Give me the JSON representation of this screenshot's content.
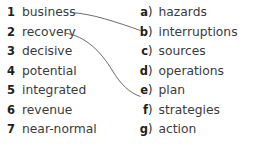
{
  "exercise": {
    "title": "matching-exercise",
    "background_color": "#ffffff",
    "text_color": "#3b3b3b",
    "marker_color": "#231f20",
    "line_color": "#5a5a5a",
    "row_spacing_px": 19.5,
    "first_row_center_y": 12
  },
  "left_column": {
    "name": "numbered-word-list",
    "items": [
      {
        "marker": "1",
        "word": "business"
      },
      {
        "marker": "2",
        "word": "recovery"
      },
      {
        "marker": "3",
        "word": "decisive"
      },
      {
        "marker": "4",
        "word": "potential"
      },
      {
        "marker": "5",
        "word": "integrated"
      },
      {
        "marker": "6",
        "word": "revenue"
      },
      {
        "marker": "7",
        "word": "near-normal"
      }
    ]
  },
  "right_column": {
    "name": "lettered-word-list",
    "paren": ")",
    "items": [
      {
        "marker": "a",
        "word": "hazards"
      },
      {
        "marker": "b",
        "word": "interruptions"
      },
      {
        "marker": "c",
        "word": "sources"
      },
      {
        "marker": "d",
        "word": "operations"
      },
      {
        "marker": "e",
        "word": "plan"
      },
      {
        "marker": "f",
        "word": "strategies"
      },
      {
        "marker": "g",
        "word": "action"
      }
    ]
  },
  "connections": [
    {
      "from": "1",
      "to": "b",
      "path": "M 70 12.5 C 92 13.5, 116 22, 140.5 30.5"
    },
    {
      "from": "2",
      "to": "e",
      "path": "M 64.5 33 C 86 36, 101 52, 112 70 C 121 85, 130 93, 140.5 96.5"
    }
  ]
}
